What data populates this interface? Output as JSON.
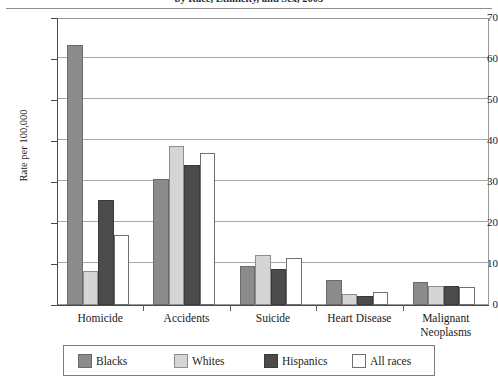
{
  "chart_data": {
    "type": "bar",
    "title": "by Race, Ethnicity, and Sex, 2005",
    "subtitle": "",
    "xlabel": "",
    "ylabel": "Rate per 100,000",
    "ylim": [
      0,
      70
    ],
    "ytick_values": [
      0,
      10,
      20,
      30,
      40,
      50,
      60,
      70
    ],
    "ytick_labels": [
      "0",
      "10",
      "20",
      "30",
      "40",
      "50",
      "60",
      "70"
    ],
    "grid": true,
    "grid_axis": "y",
    "legend_position": "bottom",
    "categories": [
      "Homicide",
      "Accidents",
      "Suicide",
      "Heart Disease",
      "Malignant Neoplasms"
    ],
    "series": [
      {
        "name": "Blacks",
        "color": "#8b8b8b",
        "values": [
          63.5,
          30.8,
          9.4,
          6.1,
          5.6
        ]
      },
      {
        "name": "Whites",
        "color": "#d5d5d5",
        "values": [
          8.3,
          38.8,
          12.2,
          2.6,
          4.7
        ]
      },
      {
        "name": "Hispanics",
        "color": "#4b4b4b",
        "values": [
          25.5,
          34.2,
          8.9,
          2.2,
          4.6
        ]
      },
      {
        "name": "All races",
        "color": "#ffffff",
        "values": [
          17.0,
          37.0,
          11.5,
          3.1,
          4.4
        ]
      }
    ]
  }
}
